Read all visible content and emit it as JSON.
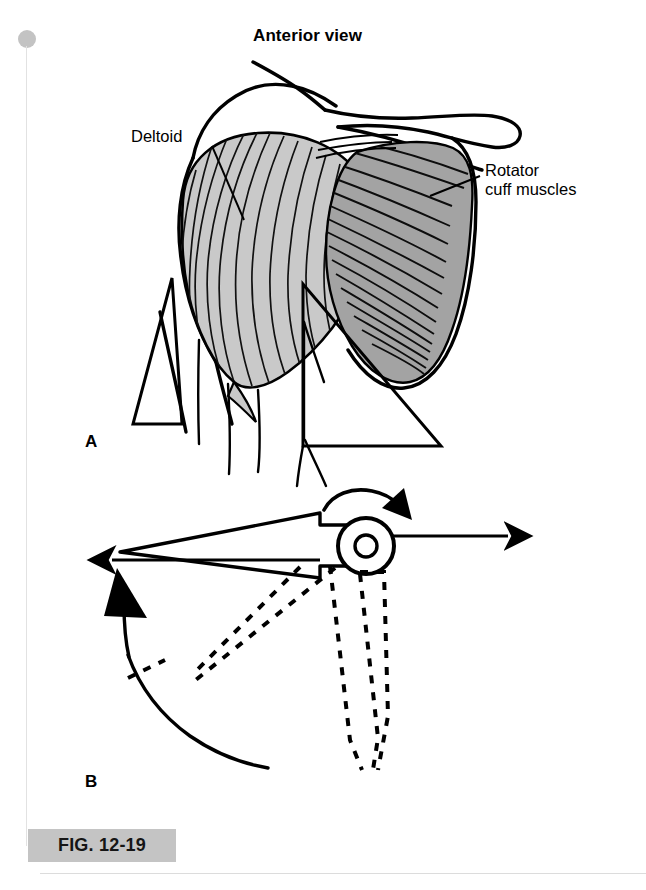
{
  "figure": {
    "caption_label": "FIG. 12-19",
    "title": "Anterior view",
    "panels": [
      {
        "id": "A",
        "label": "A",
        "description": "Anterior view of shoulder musculature showing deltoid and rotator cuff muscles with force vector triangles"
      },
      {
        "id": "B",
        "label": "B",
        "description": "Mechanical schematic of humerus at glenohumeral joint showing opposing force arrows, rotation arrow, and dashed elevation positions"
      }
    ]
  },
  "annotations": {
    "deltoid": "Deltoid",
    "rotator_cuff_line1": "Rotator",
    "rotator_cuff_line2": "cuff muscles"
  },
  "colors": {
    "ink": "#000000",
    "deltoid_fill": "#c9c9c9",
    "rotator_cuff_fill": "#a3a3a3",
    "caption_chip": "#c4c4c4",
    "spine_dot": "#c3c3c3",
    "page_background": "#ffffff"
  },
  "icons": {
    "spine_dot": "binding-dot-icon",
    "rotation_arrow": "curved-rotation-arrow-icon",
    "elevation_arrow": "curved-elevation-arrow-icon",
    "force_arrow_right": "right-arrow-icon",
    "force_arrow_left": "left-arrow-icon"
  }
}
